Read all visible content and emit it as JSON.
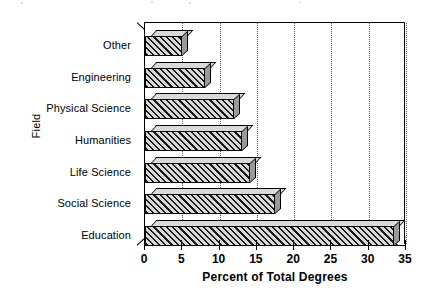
{
  "chart_data": {
    "type": "bar",
    "orientation": "horizontal",
    "title": "",
    "xlabel": "Percent of Total Degrees",
    "ylabel": "Field",
    "categories": [
      "Other",
      "Engineering",
      "Physical Science",
      "Humanities",
      "Life Science",
      "Social Science",
      "Education"
    ],
    "values": [
      4.9,
      8.0,
      11.9,
      13.0,
      14.1,
      17.4,
      33.4
    ],
    "xlim": [
      0,
      35
    ],
    "xticks": [
      0,
      5,
      10,
      15,
      20,
      25,
      30,
      35
    ],
    "xtick_labels": [
      "0",
      "5",
      "10",
      "15",
      "20",
      "25",
      "30",
      "35"
    ],
    "grid": "vertical-dotted",
    "legend": "none",
    "bar_style": {
      "fill": "#6d6d6d",
      "hatch": "diagonal-45",
      "hatch_color": "#1a1a1a",
      "edge": "#000000",
      "three_d": true,
      "top_face": "#d9d9d9",
      "side_face": "#9a9a9a"
    }
  },
  "axes": {
    "y_title": "Field",
    "x_title": "Percent of Total Degrees"
  }
}
